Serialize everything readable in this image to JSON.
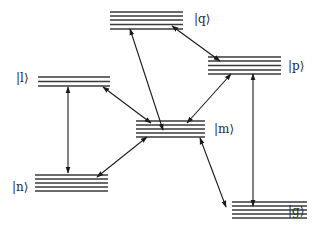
{
  "diagram": {
    "type": "energy-level-diagram",
    "levels": [
      {
        "id": "q",
        "label": "|q⟩",
        "x1": 110,
        "x2": 183,
        "ys": [
          12,
          16,
          20,
          24.5,
          29
        ],
        "label_x": 194,
        "label_y": 13
      },
      {
        "id": "l",
        "label": "|l⟩",
        "x1": 38,
        "x2": 110,
        "ys": [
          77,
          81.5,
          86
        ],
        "label_x": 16,
        "label_y": 72
      },
      {
        "id": "p",
        "label": "|p⟩",
        "x1": 208,
        "x2": 281,
        "ys": [
          57,
          61,
          65.5,
          70,
          74
        ],
        "label_x": 288,
        "label_y": 60
      },
      {
        "id": "m",
        "label": "|m⟩",
        "x1": 136,
        "x2": 205,
        "ys": [
          121,
          125,
          129,
          133,
          137
        ],
        "label_x": 214,
        "label_y": 123
      },
      {
        "id": "n",
        "label": "|n⟩",
        "x1": 35,
        "x2": 108,
        "ys": [
          175,
          179,
          183,
          187,
          191
        ],
        "label_x": 12,
        "label_y": 181
      },
      {
        "id": "g",
        "label": "|g⟩",
        "x1": 232,
        "x2": 307,
        "ys": [
          202,
          206,
          210,
          214,
          218
        ],
        "label_x": 288,
        "label_y": 205
      }
    ],
    "transitions": [
      {
        "from": "q",
        "to": "m",
        "x1": 130,
        "y1": 29,
        "x2": 163,
        "y2": 130
      },
      {
        "from": "q",
        "to": "p",
        "x1": 172,
        "y1": 26,
        "x2": 220,
        "y2": 61
      },
      {
        "from": "l",
        "to": "m",
        "x1": 103,
        "y1": 87,
        "x2": 151,
        "y2": 123
      },
      {
        "from": "l",
        "to": "n",
        "x1": 68,
        "y1": 87,
        "x2": 68,
        "y2": 173
      },
      {
        "from": "p",
        "to": "m",
        "x1": 231,
        "y1": 74,
        "x2": 187,
        "y2": 123
      },
      {
        "from": "p",
        "to": "g",
        "x1": 253,
        "y1": 74,
        "x2": 253,
        "y2": 206
      },
      {
        "from": "m",
        "to": "n",
        "x1": 147,
        "y1": 137,
        "x2": 97,
        "y2": 177
      },
      {
        "from": "m",
        "to": "g",
        "x1": 200,
        "y1": 138,
        "x2": 226,
        "y2": 207
      }
    ],
    "colors": {
      "background": "#ffffff",
      "lines": "#3a3a3a",
      "arrows": "#1a1a1a",
      "text": "#2a2a2a"
    }
  }
}
